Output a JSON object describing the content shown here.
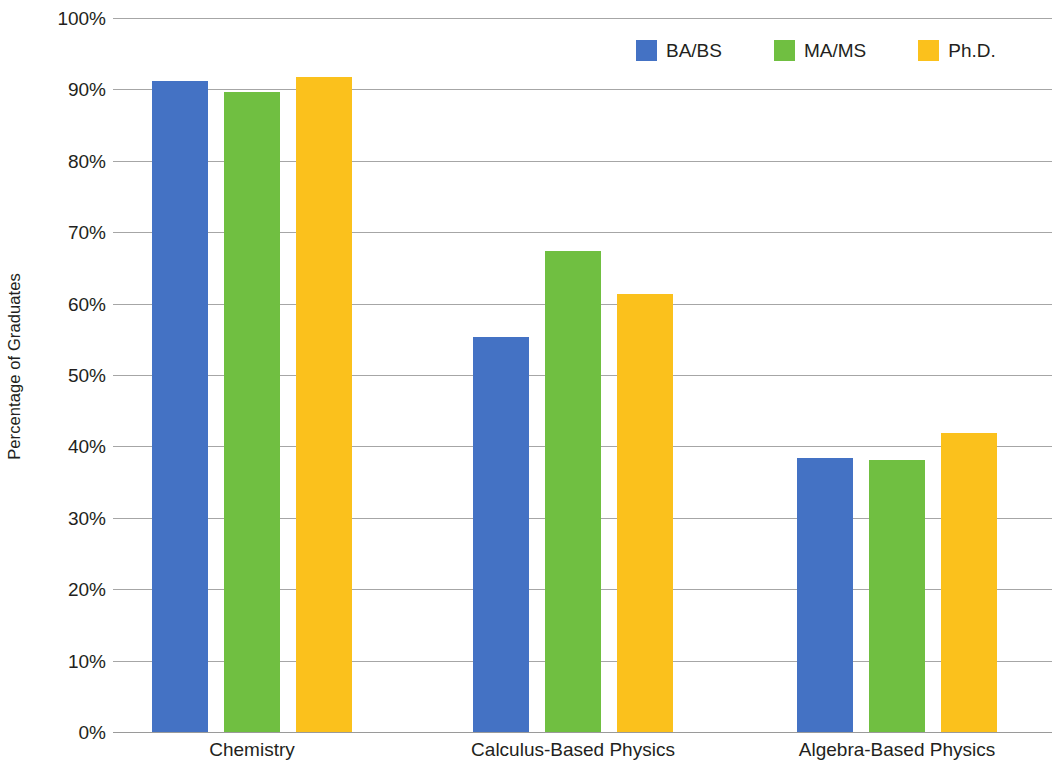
{
  "chart_data": {
    "type": "bar",
    "title": "",
    "subtitle": "",
    "xlabel": "",
    "ylabel": "Percentage of Graduates",
    "categories": [
      "Chemistry",
      "Calculus-Based Physics",
      "Algebra-Based Physics"
    ],
    "series": [
      {
        "name": "BA/BS",
        "color": "#4472c4",
        "values": [
          91.2,
          55.3,
          38.4
        ]
      },
      {
        "name": "MA/MS",
        "color": "#70bf41",
        "values": [
          89.7,
          67.4,
          38.1
        ]
      },
      {
        "name": "Ph.D.",
        "color": "#fbc11c",
        "values": [
          91.7,
          61.3,
          41.9
        ]
      }
    ],
    "ylim": [
      0,
      100
    ],
    "y_ticks": [
      0,
      10,
      20,
      30,
      40,
      50,
      60,
      70,
      80,
      90,
      100
    ],
    "y_tick_labels": [
      "0%",
      "10%",
      "20%",
      "30%",
      "40%",
      "50%",
      "60%",
      "70%",
      "80%",
      "90%",
      "100%"
    ],
    "y_tick_suffix": "%",
    "grid": true,
    "grid_axis": "y",
    "legend_position": "top-right",
    "legend_entries": [
      "BA/BS",
      "MA/MS",
      "Ph.D."
    ],
    "bar_group_gap_px": 16,
    "bar_width_px": 56
  },
  "axes": {
    "y_title": "Percentage of Graduates"
  },
  "colors": {
    "blue": "#4472c4",
    "green": "#70bf41",
    "yellow": "#fbc11c",
    "grid": "#a6a6a6",
    "text": "#231f20",
    "background": "#ffffff"
  }
}
